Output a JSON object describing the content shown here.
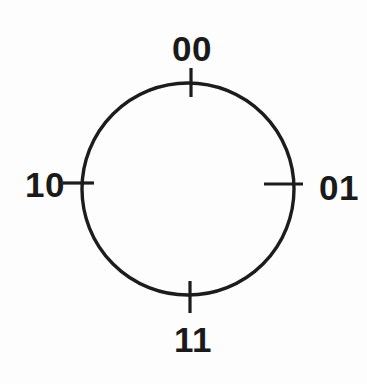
{
  "diagram": {
    "circle_labels": {
      "top": "00",
      "right": "01",
      "bottom": "11",
      "left": "10"
    },
    "colors": {
      "stroke": "#1c1c1c",
      "text": "#1a1a1a",
      "background": "#fdfdfd"
    }
  }
}
